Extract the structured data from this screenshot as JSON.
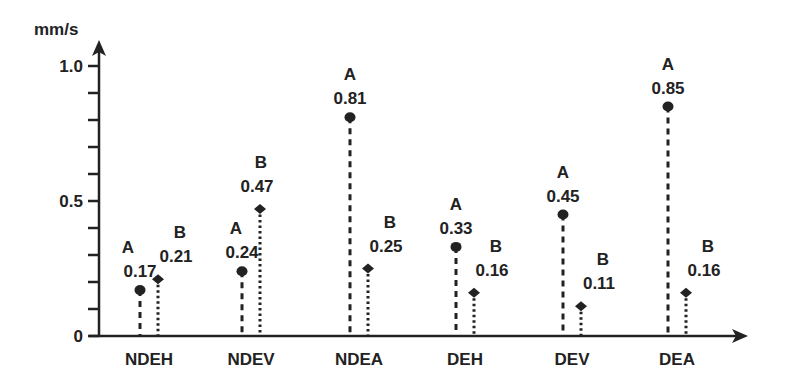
{
  "chart_data": {
    "type": "scatter",
    "subtype": "lollipop / stem plot",
    "title": "",
    "xlabel": "",
    "ylabel": "mm/s",
    "ylim": [
      0,
      1.0
    ],
    "y_ticks": [
      0,
      0.1,
      0.2,
      0.3,
      0.4,
      0.5,
      0.6,
      0.7,
      0.8,
      0.9,
      1.0
    ],
    "y_tick_labels": [
      {
        "value": 0,
        "label": "0"
      },
      {
        "value": 0.5,
        "label": "0.5"
      },
      {
        "value": 1.0,
        "label": "1.0"
      }
    ],
    "grid": false,
    "categories": [
      "NDEH",
      "NDEV",
      "NDEA",
      "DEH",
      "DEV",
      "DEA"
    ],
    "series": [
      {
        "name": "A",
        "marker": "circle",
        "line": "dashed",
        "values": [
          0.17,
          0.24,
          0.81,
          0.33,
          0.45,
          0.85
        ],
        "labels": [
          "0.17",
          "0.24",
          "0.81",
          "0.33",
          "0.45",
          "0.85"
        ]
      },
      {
        "name": "B",
        "marker": "diamond",
        "line": "dotted",
        "values": [
          0.21,
          0.47,
          0.25,
          0.16,
          0.11,
          0.16
        ],
        "labels": [
          "0.21",
          "0.47",
          "0.25",
          "0.16",
          "0.11",
          "0.16"
        ]
      }
    ],
    "colors": {
      "ink": "#222222",
      "background": "#ffffff"
    }
  }
}
